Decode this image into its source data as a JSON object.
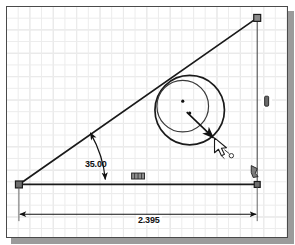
{
  "app": {
    "type": "cad-sketch-canvas",
    "title": "Sketch Drawing Area"
  },
  "canvas": {
    "background_color": "#ffffff",
    "grid_color_minor": "#ececec",
    "grid_color_major": "#dedede",
    "border_color": "#4a4a4a",
    "shadow_color": "#9b9b9b",
    "geometry_color": "#1a1a1a",
    "dimension_color": "#111111"
  },
  "dimensions": [
    {
      "id": "angle-dimension",
      "name": "angle-dimension",
      "value": "35.00",
      "kind": "angular",
      "units": "degrees"
    },
    {
      "id": "length-dimension",
      "name": "horizontal-length-dimension",
      "value": "2.395",
      "kind": "linear",
      "units": "inches"
    }
  ],
  "geometry": {
    "lines": [
      {
        "name": "horizontal-base-line",
        "x1": 18,
        "y1": 185,
        "x2": 258,
        "y2": 185
      },
      {
        "name": "inclined-hypotenuse-line",
        "x1": 18,
        "y1": 185,
        "x2": 258,
        "y2": 17
      },
      {
        "name": "vertical-right-line",
        "x1": 258,
        "y1": 17,
        "x2": 258,
        "y2": 185
      }
    ],
    "circles": [
      {
        "name": "outer-circle",
        "cx": 190,
        "cy": 110,
        "r": 35
      },
      {
        "name": "inner-circle",
        "cx": 183,
        "cy": 106,
        "r": 26
      }
    ],
    "points": [
      {
        "name": "outer-circle-center-point",
        "cx": 183,
        "cy": 101
      },
      {
        "name": "inner-circle-center-point",
        "cx": 190,
        "cy": 113
      }
    ],
    "endpoints": [
      {
        "name": "bottom-left-endpoint-handle",
        "cx": 18,
        "cy": 185
      },
      {
        "name": "top-right-endpoint-handle",
        "cx": 258,
        "cy": 17
      },
      {
        "name": "bottom-right-endpoint-handle",
        "cx": 258,
        "cy": 185
      }
    ]
  },
  "constraints": [
    {
      "name": "vertical-constraint-icon",
      "x": 263,
      "y": 96,
      "symbol": "vertical"
    },
    {
      "name": "horizontal-constraint-icon",
      "x": 131,
      "y": 174,
      "symbol": "horizontal"
    },
    {
      "name": "coincident-constraint-icon",
      "x": 252,
      "y": 168,
      "symbol": "coincident"
    }
  ],
  "cursor": {
    "name": "mouse-cursor",
    "x": 216,
    "y": 139,
    "tool_hint": "dimension-tool"
  },
  "leader": {
    "name": "radius-leader-arrow",
    "x1": 185,
    "y1": 113,
    "x2": 215,
    "y2": 140
  }
}
